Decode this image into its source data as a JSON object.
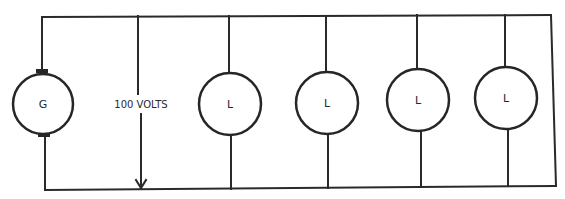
{
  "diagram": {
    "type": "parallel-circuit",
    "generator": {
      "label": "G",
      "cx": 43,
      "cy": 104,
      "r": 30
    },
    "voltage": {
      "label": "100 VOLTS",
      "x": 140
    },
    "loads": [
      {
        "label": "L",
        "cx": 230,
        "cy": 104,
        "r": 31
      },
      {
        "label": "L",
        "cx": 327,
        "cy": 103,
        "r": 31
      },
      {
        "label": "L",
        "cx": 418,
        "cy": 100,
        "r": 31
      },
      {
        "label": "L",
        "cx": 506,
        "cy": 98,
        "r": 31
      }
    ],
    "colors": {
      "line": "#2a2a2a",
      "background": "#ffffff"
    }
  }
}
